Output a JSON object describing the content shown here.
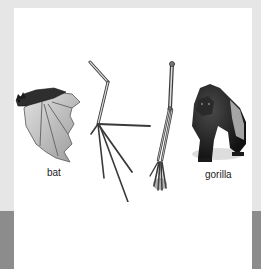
{
  "figure": {
    "topic": "homologous forelimb structures",
    "organisms": [
      {
        "id": "bat",
        "label": "bat",
        "type": "animal-illustration"
      },
      {
        "id": "bat-forelimb",
        "label": "",
        "type": "skeleton-illustration"
      },
      {
        "id": "gorilla-forelimb",
        "label": "",
        "type": "skeleton-illustration"
      },
      {
        "id": "gorilla",
        "label": "gorilla",
        "type": "animal-illustration"
      }
    ]
  },
  "colors": {
    "frame_light": "#e6e6e6",
    "frame_dark": "#8c8c8c",
    "panel": "#ffffff",
    "text": "#222222"
  }
}
